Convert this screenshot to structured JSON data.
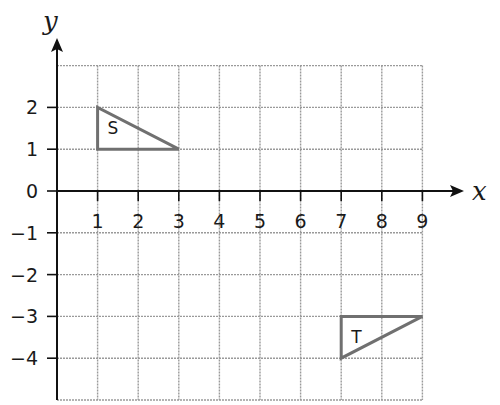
{
  "diagram": {
    "axes": {
      "x_label": "x",
      "y_label": "y",
      "x_ticks": [
        "1",
        "2",
        "3",
        "4",
        "5",
        "6",
        "7",
        "8",
        "9"
      ],
      "y_ticks": [
        {
          "value": 2,
          "label": "2"
        },
        {
          "value": 1,
          "label": "1"
        },
        {
          "value": 0,
          "label": "0"
        },
        {
          "value": -1,
          "label": "−1"
        },
        {
          "value": -2,
          "label": "−2"
        },
        {
          "value": -3,
          "label": "−3"
        },
        {
          "value": -4,
          "label": "−4"
        }
      ],
      "grid_x_range": [
        0,
        9
      ],
      "grid_y_range": [
        -5,
        3
      ]
    },
    "shapes": [
      {
        "name": "S",
        "label": "S",
        "vertices": [
          [
            1,
            2
          ],
          [
            1,
            1
          ],
          [
            3,
            1
          ]
        ]
      },
      {
        "name": "T",
        "label": "T",
        "vertices": [
          [
            7,
            -3
          ],
          [
            9,
            -3
          ],
          [
            7,
            -4
          ]
        ]
      }
    ],
    "colors": {
      "grid": "#9a9a9a",
      "axis": "#111111",
      "shape_stroke": "#707070"
    }
  }
}
